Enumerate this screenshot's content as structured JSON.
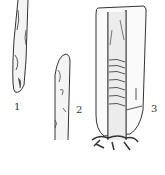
{
  "figure": {
    "panels": [
      {
        "label": "1",
        "description": "cut branch segment with slanted end"
      },
      {
        "label": "2",
        "description": "scion with slanted cut tip"
      },
      {
        "label": "3",
        "description": "grafted stem wrapped with tape inside protective bag, roots at base"
      }
    ],
    "caption": ""
  }
}
